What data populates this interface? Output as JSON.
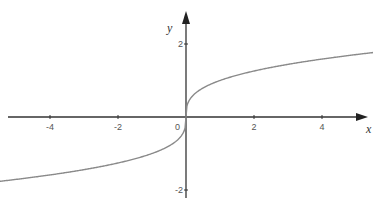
{
  "chart_data": {
    "type": "line",
    "title": "",
    "function": "y = cbrt(x)",
    "xlabel": "x",
    "ylabel": "y",
    "xlim": [
      -5.5,
      5.5
    ],
    "ylim": [
      -2.2,
      2.6
    ],
    "x_ticks": [
      -4,
      -2,
      0,
      2,
      4
    ],
    "x_tick_labels": [
      "-4",
      "-2",
      "0",
      "2",
      "4"
    ],
    "y_ticks": [
      2,
      -2
    ],
    "y_tick_labels": [
      "2",
      "-2"
    ],
    "grid": false,
    "legend": null,
    "series": [
      {
        "name": "y = ∛x",
        "x": [
          -5.5,
          -4,
          -2,
          -1,
          -0.5,
          -0.1,
          0,
          0.1,
          0.5,
          1,
          2,
          4,
          5.5
        ],
        "y": [
          -1.77,
          -1.59,
          -1.26,
          -1.0,
          -0.79,
          -0.46,
          0,
          0.46,
          0.79,
          1.0,
          1.26,
          1.59,
          1.77
        ]
      }
    ],
    "colors": {
      "curve": "#8a8a8a",
      "axes": "#333333"
    }
  }
}
